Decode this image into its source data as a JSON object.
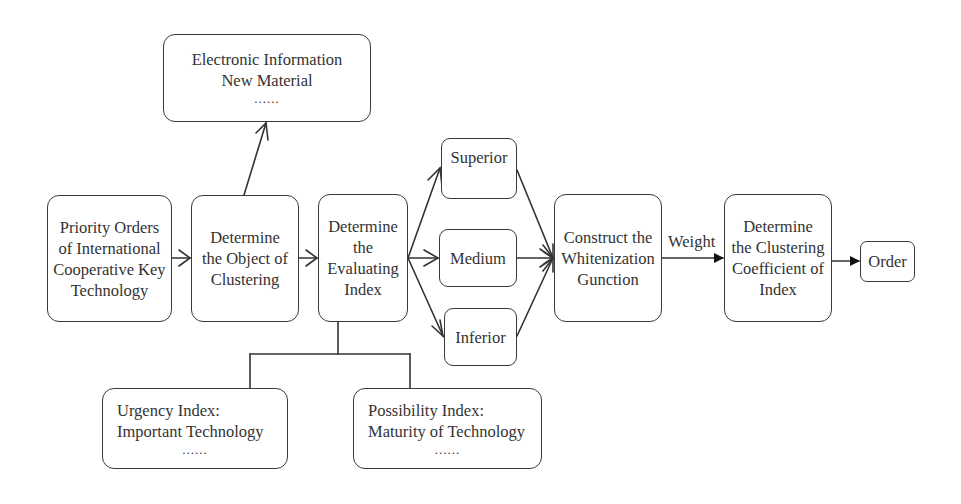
{
  "diagram": {
    "nodes": {
      "fields": {
        "lines": [
          "Electronic Information",
          "New Material"
        ],
        "ellipsis": "......"
      },
      "priority": {
        "lines": [
          "Priority Orders",
          "of International",
          "Cooperative Key",
          "Technology"
        ]
      },
      "object": {
        "lines": [
          "Determine",
          "the Object of",
          "Clustering"
        ]
      },
      "evaluating": {
        "lines": [
          "Determine",
          "the",
          "Evaluating",
          "Index"
        ]
      },
      "superior": {
        "lines": [
          "Superior"
        ]
      },
      "medium": {
        "lines": [
          "Medium"
        ]
      },
      "inferior": {
        "lines": [
          "Inferior"
        ]
      },
      "whitenization": {
        "lines": [
          "Construct the",
          "Whitenization",
          "Gunction"
        ]
      },
      "clustering": {
        "lines": [
          "Determine",
          "the Clustering",
          "Coefficient of",
          "Index"
        ]
      },
      "order": {
        "lines": [
          "Order"
        ]
      },
      "urgency": {
        "lines": [
          "Urgency Index:",
          "Important Technology"
        ],
        "ellipsis": "......"
      },
      "possibility": {
        "lines": [
          "Possibility Index:",
          "Maturity of Technology"
        ],
        "ellipsis": "......"
      }
    },
    "edge_labels": {
      "weight": "Weight"
    },
    "edges": [
      {
        "from": "priority",
        "to": "object",
        "style": "open-arrow"
      },
      {
        "from": "object",
        "to": "fields",
        "style": "open-arrow"
      },
      {
        "from": "object",
        "to": "evaluating",
        "style": "open-arrow"
      },
      {
        "from": "evaluating",
        "to": "superior",
        "style": "open-arrow"
      },
      {
        "from": "evaluating",
        "to": "medium",
        "style": "open-arrow"
      },
      {
        "from": "evaluating",
        "to": "inferior",
        "style": "open-arrow"
      },
      {
        "from": "superior",
        "to": "whitenization",
        "style": "open-arrow"
      },
      {
        "from": "medium",
        "to": "whitenization",
        "style": "open-arrow"
      },
      {
        "from": "inferior",
        "to": "whitenization",
        "style": "open-arrow"
      },
      {
        "from": "whitenization",
        "to": "clustering",
        "style": "filled-arrow",
        "label": "Weight"
      },
      {
        "from": "clustering",
        "to": "order",
        "style": "filled-arrow"
      },
      {
        "from": "evaluating",
        "to": "urgency",
        "style": "tree-line"
      },
      {
        "from": "evaluating",
        "to": "possibility",
        "style": "tree-line"
      }
    ]
  }
}
